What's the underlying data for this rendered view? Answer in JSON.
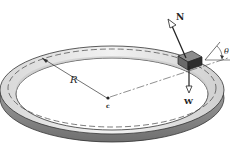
{
  "diagram": {
    "labels": {
      "normal_force": "N",
      "weight": "W",
      "radius": "R",
      "center": "c",
      "bank_angle": "θ"
    },
    "colors": {
      "ink": "#222222",
      "track_top": "#e6e6e6",
      "track_side": "#8a8a8a",
      "block": "#5a5a5a",
      "background": "#ffffff"
    }
  }
}
